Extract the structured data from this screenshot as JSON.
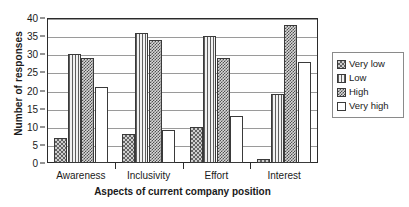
{
  "chart_data": {
    "type": "bar",
    "title": "",
    "xlabel": "Aspects of current company position",
    "ylabel": "Number of responses",
    "categories": [
      "Awareness",
      "Inclusivity",
      "Effort",
      "Interest"
    ],
    "series": [
      {
        "name": "Very low",
        "values": [
          7,
          8,
          10,
          1
        ],
        "pattern": "diagonal-checker",
        "color": "#9a9a9a"
      },
      {
        "name": "Low",
        "values": [
          30,
          36,
          35,
          19
        ],
        "pattern": "vertical-stripes",
        "color": "#bdbdbd"
      },
      {
        "name": "High",
        "values": [
          29,
          34,
          29,
          38
        ],
        "pattern": "dense-checker",
        "color": "#8f8f8f"
      },
      {
        "name": "Very high",
        "values": [
          21,
          9,
          13,
          28
        ],
        "pattern": "solid-white",
        "color": "#ffffff"
      }
    ],
    "ylim": [
      0,
      40
    ],
    "ytick_step": 5,
    "yticks": [
      0,
      5,
      10,
      15,
      20,
      25,
      30,
      35,
      40
    ],
    "grid": true,
    "grid_axis": "y",
    "legend_position": "right",
    "legend_entries": [
      "Very low",
      "Low",
      "High",
      "Very high"
    ]
  }
}
